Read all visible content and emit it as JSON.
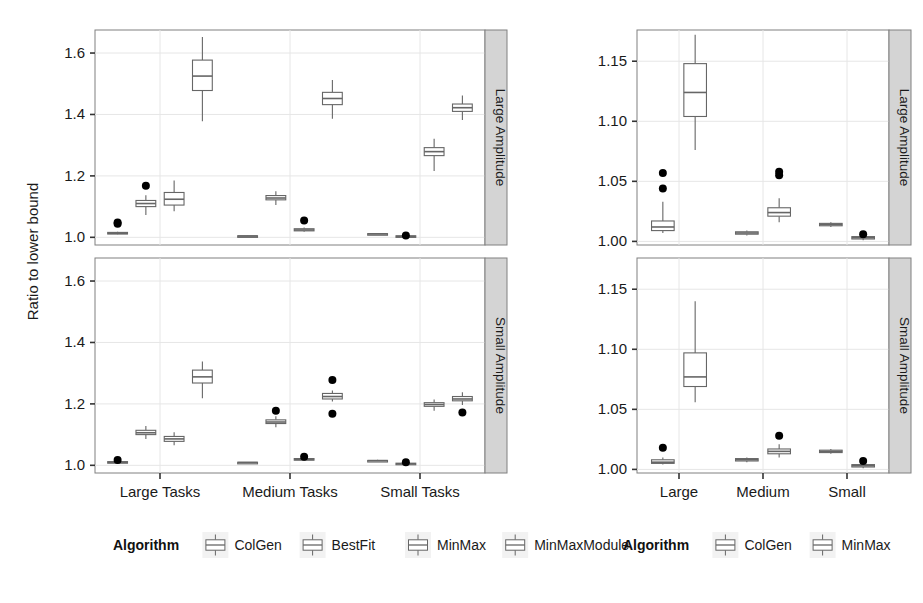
{
  "figure": {
    "ylabel": "Ratio to lower bound",
    "background": "#ffffff",
    "panel_border": "#808080",
    "grid_color": "#e6e6e6",
    "strip_fill": "#d4d4d4",
    "box_stroke": "#666666",
    "outlier_color": "#000000"
  },
  "panels": {
    "left": {
      "strip_top": "Large Amplitude",
      "strip_bottom": "Small Amplitude",
      "xticks": [
        "Large Tasks",
        "Medium Tasks",
        "Small Tasks"
      ],
      "yticks": [
        "1.0",
        "1.2",
        "1.4",
        "1.6"
      ],
      "legend_title": "Algorithm",
      "legend_items": [
        "ColGen",
        "BestFit",
        "MinMax",
        "MinMaxModule"
      ]
    },
    "right": {
      "strip_top": "Large Amplitude",
      "strip_bottom": "Small Amplitude",
      "xticks": [
        "Large",
        "Medium",
        "Small"
      ],
      "yticks": [
        "1.00",
        "1.05",
        "1.10",
        "1.15"
      ],
      "legend_title": "Algorithm",
      "legend_items": [
        "ColGen",
        "MinMax"
      ]
    }
  },
  "chart_data": [
    {
      "id": "left-large-amplitude",
      "type": "boxplot",
      "title": "Large Amplitude",
      "xlabel": "",
      "ylabel": "Ratio to lower bound",
      "ylim": [
        0.975,
        1.675
      ],
      "yticks": [
        1.0,
        1.2,
        1.4,
        1.6
      ],
      "grid": true,
      "categories": [
        "Large Tasks",
        "Medium Tasks",
        "Small Tasks"
      ],
      "legend": [
        "ColGen",
        "BestFit",
        "MinMax",
        "MinMaxModule"
      ],
      "legend_position": "bottom",
      "boxes": [
        {
          "group": "Large Tasks",
          "algorithm": "ColGen",
          "min": 1.01,
          "q1": 1.011,
          "median": 1.013,
          "q3": 1.016,
          "max": 1.018,
          "outliers": [
            1.044,
            1.048
          ]
        },
        {
          "group": "Large Tasks",
          "algorithm": "BestFit",
          "min": 1.073,
          "q1": 1.1,
          "median": 1.11,
          "q3": 1.12,
          "max": 1.137,
          "outliers": [
            1.168
          ]
        },
        {
          "group": "Large Tasks",
          "algorithm": "MinMax",
          "min": 1.085,
          "q1": 1.105,
          "median": 1.124,
          "q3": 1.146,
          "max": 1.185,
          "outliers": []
        },
        {
          "group": "Large Tasks",
          "algorithm": "MinMaxModule",
          "min": 1.378,
          "q1": 1.478,
          "median": 1.525,
          "q3": 1.577,
          "max": 1.652,
          "outliers": []
        },
        {
          "group": "Medium Tasks",
          "algorithm": "ColGen",
          "min": 1.002,
          "q1": 1.003,
          "median": 1.004,
          "q3": 1.005,
          "max": 1.006,
          "outliers": []
        },
        {
          "group": "Medium Tasks",
          "algorithm": "BestFit",
          "min": 1.105,
          "q1": 1.122,
          "median": 1.128,
          "q3": 1.136,
          "max": 1.15,
          "outliers": []
        },
        {
          "group": "Medium Tasks",
          "algorithm": "MinMax",
          "min": 1.018,
          "q1": 1.021,
          "median": 1.024,
          "q3": 1.028,
          "max": 1.032,
          "outliers": [
            1.055
          ]
        },
        {
          "group": "Medium Tasks",
          "algorithm": "MinMaxModule",
          "min": 1.386,
          "q1": 1.432,
          "median": 1.452,
          "q3": 1.472,
          "max": 1.512,
          "outliers": []
        },
        {
          "group": "Small Tasks",
          "algorithm": "ColGen",
          "min": 1.009,
          "q1": 1.01,
          "median": 1.011,
          "q3": 1.012,
          "max": 1.013,
          "outliers": []
        },
        {
          "group": "Small Tasks",
          "algorithm": "BestFit",
          "min": 1.0,
          "q1": 1.001,
          "median": 1.003,
          "q3": 1.005,
          "max": 1.006,
          "outliers": [
            1.006
          ]
        },
        {
          "group": "Small Tasks",
          "algorithm": "MinMax",
          "min": 1.216,
          "q1": 1.266,
          "median": 1.279,
          "q3": 1.292,
          "max": 1.321,
          "outliers": []
        },
        {
          "group": "Small Tasks",
          "algorithm": "MinMaxModule",
          "min": 1.382,
          "q1": 1.41,
          "median": 1.422,
          "q3": 1.434,
          "max": 1.462,
          "outliers": []
        }
      ]
    },
    {
      "id": "left-small-amplitude",
      "type": "boxplot",
      "title": "Small Amplitude",
      "xlabel": "",
      "ylabel": "Ratio to lower bound",
      "ylim": [
        0.975,
        1.675
      ],
      "yticks": [
        1.0,
        1.2,
        1.4,
        1.6
      ],
      "grid": true,
      "categories": [
        "Large Tasks",
        "Medium Tasks",
        "Small Tasks"
      ],
      "legend": [
        "ColGen",
        "BestFit",
        "MinMax",
        "MinMaxModule"
      ],
      "legend_position": "bottom",
      "boxes": [
        {
          "group": "Large Tasks",
          "algorithm": "ColGen",
          "min": 1.007,
          "q1": 1.008,
          "median": 1.01,
          "q3": 1.012,
          "max": 1.013,
          "outliers": [
            1.017
          ]
        },
        {
          "group": "Large Tasks",
          "algorithm": "BestFit",
          "min": 1.086,
          "q1": 1.1,
          "median": 1.106,
          "q3": 1.114,
          "max": 1.128,
          "outliers": []
        },
        {
          "group": "Large Tasks",
          "algorithm": "MinMax",
          "min": 1.065,
          "q1": 1.078,
          "median": 1.086,
          "q3": 1.094,
          "max": 1.108,
          "outliers": []
        },
        {
          "group": "Large Tasks",
          "algorithm": "MinMaxModule",
          "min": 1.218,
          "q1": 1.268,
          "median": 1.288,
          "q3": 1.31,
          "max": 1.338,
          "outliers": []
        },
        {
          "group": "Medium Tasks",
          "algorithm": "ColGen",
          "min": 1.007,
          "q1": 1.008,
          "median": 1.009,
          "q3": 1.01,
          "max": 1.011,
          "outliers": []
        },
        {
          "group": "Medium Tasks",
          "algorithm": "BestFit",
          "min": 1.124,
          "q1": 1.136,
          "median": 1.141,
          "q3": 1.148,
          "max": 1.16,
          "outliers": [
            1.178
          ]
        },
        {
          "group": "Medium Tasks",
          "algorithm": "MinMax",
          "min": 1.014,
          "q1": 1.017,
          "median": 1.019,
          "q3": 1.022,
          "max": 1.024,
          "outliers": [
            1.028
          ]
        },
        {
          "group": "Medium Tasks",
          "algorithm": "MinMaxModule",
          "min": 1.208,
          "q1": 1.216,
          "median": 1.224,
          "q3": 1.234,
          "max": 1.244,
          "outliers": [
            1.278,
            1.168
          ]
        },
        {
          "group": "Small Tasks",
          "algorithm": "ColGen",
          "min": 1.012,
          "q1": 1.014,
          "median": 1.015,
          "q3": 1.016,
          "max": 1.018,
          "outliers": []
        },
        {
          "group": "Small Tasks",
          "algorithm": "BestFit",
          "min": 1.002,
          "q1": 1.004,
          "median": 1.005,
          "q3": 1.007,
          "max": 1.008,
          "outliers": [
            1.01
          ]
        },
        {
          "group": "Small Tasks",
          "algorithm": "MinMax",
          "min": 1.178,
          "q1": 1.192,
          "median": 1.198,
          "q3": 1.204,
          "max": 1.214,
          "outliers": []
        },
        {
          "group": "Small Tasks",
          "algorithm": "MinMaxModule",
          "min": 1.196,
          "q1": 1.21,
          "median": 1.216,
          "q3": 1.224,
          "max": 1.238,
          "outliers": [
            1.172
          ]
        }
      ]
    },
    {
      "id": "right-large-amplitude",
      "type": "boxplot",
      "title": "Large Amplitude",
      "xlabel": "",
      "ylabel": "",
      "ylim": [
        0.997,
        1.176
      ],
      "yticks": [
        1.0,
        1.05,
        1.1,
        1.15
      ],
      "grid": true,
      "categories": [
        "Large",
        "Medium",
        "Small"
      ],
      "legend": [
        "ColGen",
        "MinMax"
      ],
      "legend_position": "bottom",
      "boxes": [
        {
          "group": "Large",
          "algorithm": "ColGen",
          "min": 1.007,
          "q1": 1.009,
          "median": 1.012,
          "q3": 1.017,
          "max": 1.033,
          "outliers": [
            1.044,
            1.057
          ]
        },
        {
          "group": "Large",
          "algorithm": "MinMax",
          "min": 1.076,
          "q1": 1.104,
          "median": 1.124,
          "q3": 1.148,
          "max": 1.172,
          "outliers": []
        },
        {
          "group": "Medium",
          "algorithm": "ColGen",
          "min": 1.005,
          "q1": 1.006,
          "median": 1.007,
          "q3": 1.008,
          "max": 1.009,
          "outliers": []
        },
        {
          "group": "Medium",
          "algorithm": "MinMax",
          "min": 1.016,
          "q1": 1.021,
          "median": 1.024,
          "q3": 1.028,
          "max": 1.036,
          "outliers": [
            1.055,
            1.058
          ]
        },
        {
          "group": "Small",
          "algorithm": "ColGen",
          "min": 1.012,
          "q1": 1.013,
          "median": 1.014,
          "q3": 1.015,
          "max": 1.016,
          "outliers": []
        },
        {
          "group": "Small",
          "algorithm": "MinMax",
          "min": 1.001,
          "q1": 1.002,
          "median": 1.003,
          "q3": 1.004,
          "max": 1.005,
          "outliers": [
            1.006
          ]
        }
      ]
    },
    {
      "id": "right-small-amplitude",
      "type": "boxplot",
      "title": "Small Amplitude",
      "xlabel": "",
      "ylabel": "",
      "ylim": [
        0.997,
        1.176
      ],
      "yticks": [
        1.0,
        1.05,
        1.1,
        1.15
      ],
      "grid": true,
      "categories": [
        "Large",
        "Medium",
        "Small"
      ],
      "legend": [
        "ColGen",
        "MinMax"
      ],
      "legend_position": "bottom",
      "boxes": [
        {
          "group": "Large",
          "algorithm": "ColGen",
          "min": 1.004,
          "q1": 1.005,
          "median": 1.006,
          "q3": 1.008,
          "max": 1.01,
          "outliers": [
            1.018
          ]
        },
        {
          "group": "Large",
          "algorithm": "MinMax",
          "min": 1.056,
          "q1": 1.069,
          "median": 1.077,
          "q3": 1.097,
          "max": 1.14,
          "outliers": []
        },
        {
          "group": "Medium",
          "algorithm": "ColGen",
          "min": 1.006,
          "q1": 1.007,
          "median": 1.008,
          "q3": 1.009,
          "max": 1.01,
          "outliers": []
        },
        {
          "group": "Medium",
          "algorithm": "MinMax",
          "min": 1.01,
          "q1": 1.013,
          "median": 1.015,
          "q3": 1.017,
          "max": 1.021,
          "outliers": [
            1.028
          ]
        },
        {
          "group": "Small",
          "algorithm": "ColGen",
          "min": 1.013,
          "q1": 1.014,
          "median": 1.015,
          "q3": 1.016,
          "max": 1.017,
          "outliers": []
        },
        {
          "group": "Small",
          "algorithm": "MinMax",
          "min": 1.001,
          "q1": 1.002,
          "median": 1.003,
          "q3": 1.004,
          "max": 1.005,
          "outliers": [
            1.007
          ]
        }
      ]
    }
  ]
}
